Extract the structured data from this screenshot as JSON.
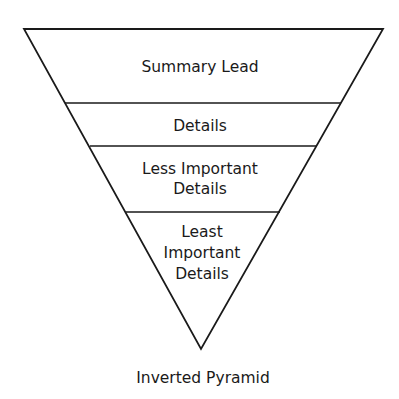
{
  "diagram": {
    "type": "inverted-pyramid",
    "caption": "Inverted Pyramid",
    "stroke_color": "#1a1a1a",
    "background": "#ffffff",
    "layers": [
      {
        "lines": [
          "Summary Lead"
        ]
      },
      {
        "lines": [
          "Details"
        ]
      },
      {
        "lines": [
          "Less Important",
          "Details"
        ]
      },
      {
        "lines": [
          "Least",
          "Important",
          "Details"
        ]
      }
    ]
  }
}
